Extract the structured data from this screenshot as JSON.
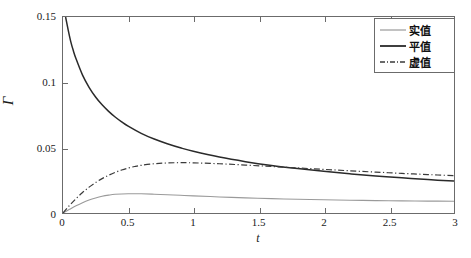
{
  "chart_data": {
    "type": "line",
    "title": "",
    "xlabel": "t",
    "ylabel": "Γ",
    "xlim": [
      0,
      3
    ],
    "ylim": [
      0,
      0.15
    ],
    "grid": false,
    "legend_position": "top-right",
    "xticks": [
      "0",
      "0.5",
      "1",
      "1.5",
      "2",
      "2.5",
      "3"
    ],
    "xtick_values": [
      0,
      0.5,
      1,
      1.5,
      2,
      2.5,
      3
    ],
    "yticks": [
      "0",
      "0.05",
      "0.1",
      "0.15"
    ],
    "ytick_values": [
      0,
      0.05,
      0.1,
      0.15
    ],
    "series": [
      {
        "name": "实值",
        "style": "solid-light",
        "color": "#9a9a9a",
        "x": [
          0,
          0.05,
          0.1,
          0.15,
          0.2,
          0.25,
          0.3,
          0.35,
          0.4,
          0.5,
          0.6,
          0.7,
          0.8,
          0.9,
          1.0,
          1.2,
          1.4,
          1.6,
          1.8,
          2.0,
          2.2,
          2.4,
          2.6,
          2.8,
          3.0
        ],
        "values": [
          0,
          0.0028,
          0.0055,
          0.0079,
          0.0099,
          0.0115,
          0.0128,
          0.0137,
          0.0143,
          0.01475,
          0.0147,
          0.0144,
          0.014,
          0.0136,
          0.0131,
          0.0123,
          0.0116,
          0.011,
          0.0105,
          0.0101,
          0.0098,
          0.0095,
          0.0093,
          0.0091,
          0.009
        ]
      },
      {
        "name": "平值",
        "style": "solid",
        "color": "#2a2a2a",
        "x": [
          0.02,
          0.04,
          0.06,
          0.08,
          0.1,
          0.15,
          0.2,
          0.25,
          0.3,
          0.35,
          0.4,
          0.45,
          0.5,
          0.6,
          0.7,
          0.8,
          0.9,
          1.0,
          1.2,
          1.4,
          1.6,
          1.8,
          2.0,
          2.2,
          2.4,
          2.6,
          2.8,
          3.0
        ],
        "values": [
          0.15,
          0.14,
          0.131,
          0.124,
          0.118,
          0.1055,
          0.0962,
          0.0888,
          0.0828,
          0.0778,
          0.0735,
          0.0698,
          0.0665,
          0.061,
          0.0566,
          0.053,
          0.0499,
          0.0472,
          0.0428,
          0.0393,
          0.0364,
          0.034,
          0.0319,
          0.03,
          0.0284,
          0.0269,
          0.0256,
          0.0244
        ]
      },
      {
        "name": "虚值",
        "style": "dashdot",
        "color": "#3a3a3a",
        "x": [
          0,
          0.05,
          0.1,
          0.15,
          0.2,
          0.25,
          0.3,
          0.35,
          0.4,
          0.45,
          0.5,
          0.55,
          0.6,
          0.7,
          0.8,
          0.9,
          1.0,
          1.2,
          1.4,
          1.6,
          1.8,
          2.0,
          2.2,
          2.4,
          2.6,
          2.8,
          3.0
        ],
        "values": [
          0,
          0.0058,
          0.011,
          0.0157,
          0.0198,
          0.0233,
          0.0263,
          0.0289,
          0.0311,
          0.0329,
          0.0344,
          0.0356,
          0.0365,
          0.0377,
          0.0383,
          0.0385,
          0.0384,
          0.0377,
          0.0367,
          0.0356,
          0.0345,
          0.0334,
          0.0323,
          0.0313,
          0.0303,
          0.0294,
          0.0286
        ]
      }
    ],
    "annotations": []
  }
}
